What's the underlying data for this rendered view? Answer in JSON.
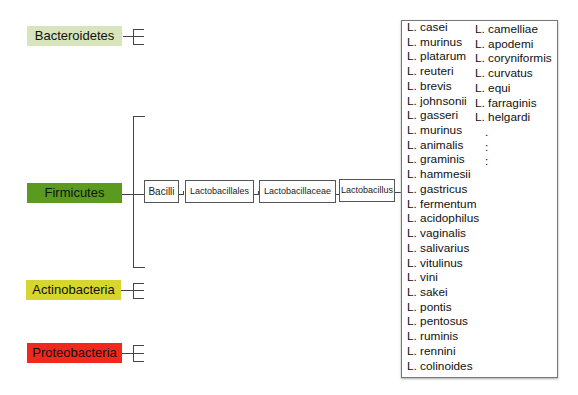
{
  "phyla": [
    {
      "label": "Bacteroidetes",
      "color": "#d7e4bc"
    },
    {
      "label": "Firmicutes",
      "color": "#5a9a1e"
    },
    {
      "label": "Actinobacteria",
      "color": "#d6d62e"
    },
    {
      "label": "Proteobacteria",
      "color": "#f0281e"
    }
  ],
  "lineage": [
    "Bacilli",
    "Lactobacillales",
    "Lactobacillaceae",
    "Lactobacillus"
  ],
  "species_col1": [
    "L. casei",
    "L. murinus",
    "L. platarum",
    "L. reuteri",
    "L. brevis",
    "L. johnsonii",
    "L. gasseri",
    "L. murinus",
    "L. animalis",
    "L. graminis",
    "L. hammesii",
    "L. gastricus",
    "L. fermentum",
    "L. acidophilus",
    "L. vaginalis",
    "L. salivarius",
    "L. vitulinus",
    "L. vini",
    "L. sakei",
    "L. pontis",
    "L. pentosus",
    "L. ruminis",
    "L. rennini",
    "L. colinoides"
  ],
  "species_col2": [
    "L. camelliae",
    "L. apodemi",
    "L. coryniformis",
    "L. curvatus",
    "L. equi",
    "L. farraginis",
    "L. helgardi",
    ".",
    ":",
    ":"
  ]
}
